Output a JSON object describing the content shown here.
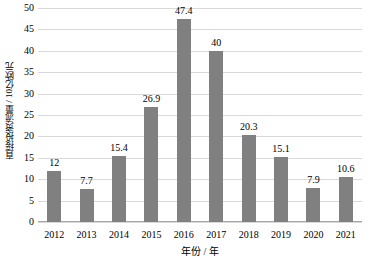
{
  "chart_data": {
    "type": "bar",
    "title": "",
    "subtitle": "",
    "xlabel": "年份 / 年",
    "ylabel": "直接投资流量 / 10亿欧元",
    "categories": [
      "2012",
      "2013",
      "2014",
      "2015",
      "2016",
      "2017",
      "2018",
      "2019",
      "2020",
      "2021"
    ],
    "values": [
      12,
      7.7,
      15.4,
      26.9,
      47.4,
      40,
      20.3,
      15.1,
      7.9,
      10.6
    ],
    "value_labels": [
      "12",
      "7.7",
      "15.4",
      "26.9",
      "47.4",
      "40",
      "20.3",
      "15.1",
      "7.9",
      "10.6"
    ],
    "ylim": [
      0,
      50
    ],
    "ytick_step": 5,
    "yticks": [
      0,
      5,
      10,
      15,
      20,
      25,
      30,
      35,
      40,
      45,
      50
    ],
    "ytick_labels": [
      "0",
      "5",
      "10",
      "15",
      "20",
      "25",
      "30",
      "35",
      "40",
      "45",
      "50"
    ],
    "grid": "horizontal",
    "legend": "none",
    "series": [
      {
        "name": "直接投资流量",
        "values": [
          12,
          7.7,
          15.4,
          26.9,
          47.4,
          40,
          20.3,
          15.1,
          7.9,
          10.6
        ]
      }
    ],
    "colors": {
      "bar": "#808080",
      "gridline": "#d9d9d9",
      "axis": "#a6a6a6",
      "text": "#000000",
      "background": "#ffffff"
    }
  }
}
